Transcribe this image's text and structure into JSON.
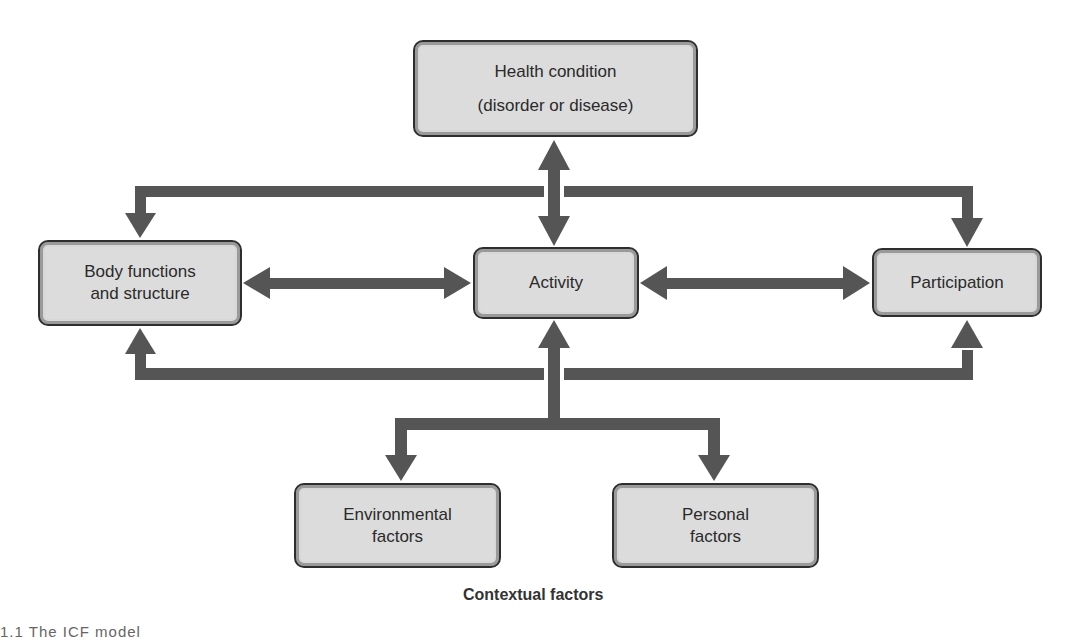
{
  "diagram": {
    "title": "ICF model",
    "arrow_color": "#555555",
    "box_fill": "#dcdcdc",
    "boxes": {
      "health": {
        "line1": "Health condition",
        "line2": "(disorder or disease)"
      },
      "body": {
        "line1": "Body functions",
        "line2": "and structure"
      },
      "activity": {
        "line1": "Activity"
      },
      "participation": {
        "line1": "Participation"
      },
      "environmental": {
        "line1": "Environmental",
        "line2": "factors"
      },
      "personal": {
        "line1": "Personal",
        "line2": "factors"
      }
    },
    "group_label": "Contextual factors",
    "figure_caption": "1.1   The ICF model"
  }
}
